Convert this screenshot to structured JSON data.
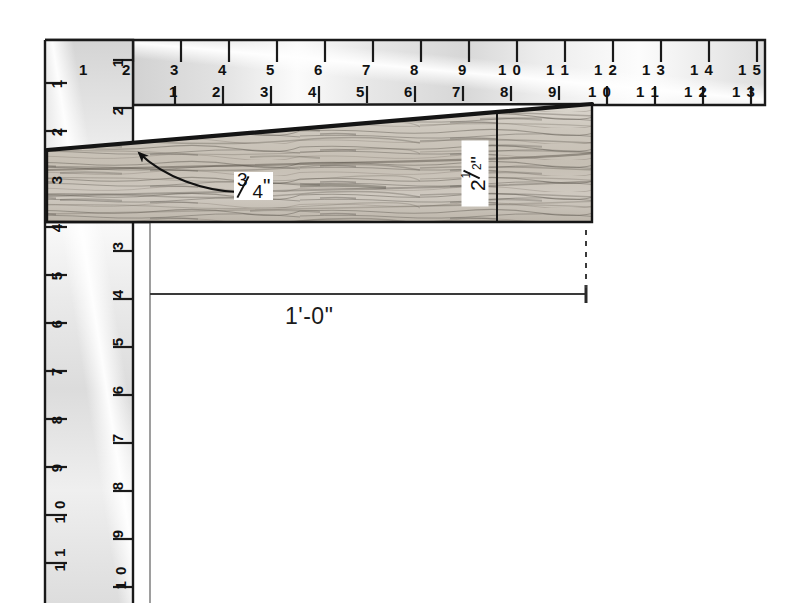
{
  "figure": {
    "type": "technical-diagram"
  },
  "top_ruler": {
    "name": "horizontal-blade",
    "outer_scale": [
      "1",
      "2",
      "3",
      "4",
      "5",
      "6",
      "7",
      "8",
      "9",
      "1 0",
      "1 1",
      "1 2",
      "1 3",
      "1 4",
      "1 5"
    ],
    "inner_scale": [
      "1",
      "2",
      "3",
      "4",
      "5",
      "6",
      "7",
      "8",
      "9",
      "1 0",
      "1 1",
      "1 2",
      "1 3"
    ]
  },
  "side_ruler": {
    "name": "vertical-tongue",
    "outer_scale": [
      "1",
      "2",
      "3",
      "4",
      "5",
      "6",
      "7",
      "8",
      "9",
      "1 0",
      "1 1"
    ],
    "inner_scale": [
      "1",
      "2",
      "3",
      "4",
      "5",
      "6",
      "7",
      "8",
      "9",
      "1 0"
    ]
  },
  "callouts": {
    "taper_thickness": {
      "numerator": "3",
      "denominator": "4",
      "unit": "\""
    },
    "depth": {
      "whole": "2",
      "numerator": "1",
      "denominator": "2",
      "unit": "\""
    },
    "length": "1'-0\""
  },
  "colors": {
    "rule_fill_light": "#f2f2f2",
    "rule_fill_dark": "#cfcfcf",
    "line": "#1a1a1a",
    "wood_base": "#cdc8c0",
    "wood_grain": "#6d675f",
    "dim_line": "#3a3a3a"
  }
}
